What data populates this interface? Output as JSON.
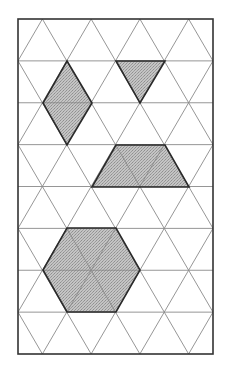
{
  "diagram": {
    "canvas": {
      "width": 228,
      "height": 372,
      "background": "#ffffff"
    },
    "frame": {
      "x": 18,
      "y": 19,
      "width": 195,
      "height": 335,
      "stroke": "#333333",
      "stroke_width": 1.6
    },
    "grid": {
      "rows": 8,
      "columns_of_bases": 4,
      "row_height": 41.875,
      "triangle_base": 48.75,
      "line_color": "#8a8a8a",
      "line_width": 0.9
    },
    "style": {
      "shape_fill": "#b9b9b9",
      "shape_stroke": "#2a2a2a",
      "shape_stroke_width": 1.6
    },
    "shapes": [
      {
        "name": "rhombus",
        "points": [
          [
            67,
            61
          ],
          [
            92,
            103
          ],
          [
            67,
            145
          ],
          [
            43,
            103
          ]
        ]
      },
      {
        "name": "triangle",
        "points": [
          [
            116,
            61
          ],
          [
            165,
            61
          ],
          [
            140,
            103
          ]
        ]
      },
      {
        "name": "trapezoid",
        "points": [
          [
            116,
            145
          ],
          [
            165,
            145
          ],
          [
            189,
            187
          ],
          [
            92,
            187
          ]
        ]
      },
      {
        "name": "hexagon",
        "points": [
          [
            67,
            228
          ],
          [
            116,
            228
          ],
          [
            140,
            270
          ],
          [
            116,
            312
          ],
          [
            67,
            312
          ],
          [
            43,
            270
          ]
        ]
      }
    ]
  }
}
